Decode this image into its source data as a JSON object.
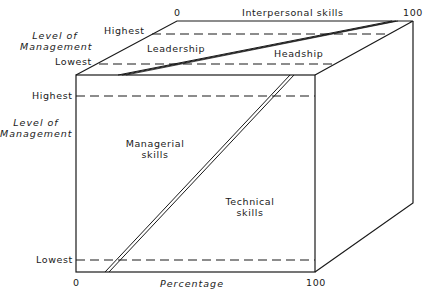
{
  "diagram": {
    "type": "3d-box-skill-mix",
    "top_face": {
      "axis_label": "Interpersonal skills",
      "axis_start": "0",
      "axis_end": "100",
      "level_axis_label": "Level of Management",
      "level_highest": "Highest",
      "level_lowest": "Lowest",
      "regions": [
        "Leadership",
        "Headship"
      ]
    },
    "front_face": {
      "axis_label": "Percentage",
      "axis_start": "0",
      "axis_end": "100",
      "level_axis_label": "Level of Management",
      "level_highest": "Highest",
      "level_lowest": "Lowest",
      "regions": [
        "Managerial skills",
        "Technical skills"
      ]
    }
  },
  "labels": {
    "top_zero": "0",
    "top_axis": "Interpersonal skills",
    "top_hundred": "100",
    "top_level_line1": "Level of",
    "top_level_line2": "Management",
    "top_highest": "Highest",
    "top_lowest": "Lowest",
    "leadership": "Leadership",
    "headship": "Headship",
    "front_highest": "Highest",
    "front_level_line1": "Level of",
    "front_level_line2": "Management",
    "managerial_line1": "Managerial",
    "managerial_line2": "skills",
    "technical_line1": "Technical",
    "technical_line2": "skills",
    "front_lowest": "Lowest",
    "bottom_zero": "0",
    "bottom_axis": "Percentage",
    "bottom_hundred": "100"
  }
}
